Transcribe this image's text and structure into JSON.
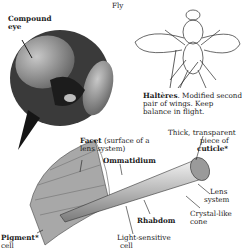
{
  "title": "Fly",
  "labels": {
    "compound_eye": {
      "line1": "Compound",
      "line2": "eye"
    },
    "halteres": {
      "term": "Haltères",
      "desc1": ". Modified second",
      "desc2": "pair of wings. Keep",
      "desc3": "balance in flight."
    },
    "cuticle": {
      "line1": "Thick, transparent",
      "line2": "piece of",
      "term": "cuticle",
      "mark": "*"
    },
    "facet": {
      "term": "Facet",
      "desc1": " (surface of a",
      "desc2": "lens system)"
    },
    "ommatidium": "Ommatidium",
    "lens_system": {
      "line1": "Lens",
      "line2": "system"
    },
    "crystal_cone": {
      "line1": "Crystal-like",
      "line2": "cone"
    },
    "rhabdom": "Rhabdom",
    "light_cell": {
      "line1": "Light-sensitive",
      "line2": "cell"
    },
    "pigment_cell": {
      "term": "Pigment",
      "mark": "*",
      "line2": "cell"
    }
  },
  "colors": {
    "ink": "#1a1a1a",
    "eye_gray": "#8c8c8c",
    "dark": "#2a2a2a",
    "light": "#d8d8d8"
  }
}
